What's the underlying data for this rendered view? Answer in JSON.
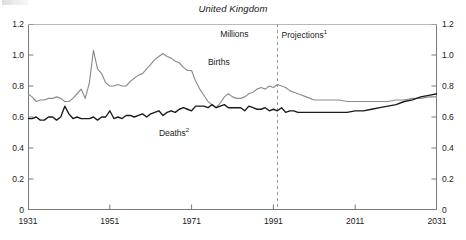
{
  "chart_data": {
    "type": "line",
    "title": "United Kingdom",
    "ylabel": "Millions",
    "xlabel": "",
    "xlim": [
      1931,
      2031
    ],
    "ylim": [
      0,
      1.2
    ],
    "yticks": [
      "0",
      "0.2",
      "0.4",
      "0.6",
      "0.8",
      "1.0",
      "1.2"
    ],
    "ytick_values": [
      0,
      0.2,
      0.4,
      0.6,
      0.8,
      1.0,
      1.2
    ],
    "yticks_right": [
      "0",
      "0.2",
      "0.4",
      "0.6",
      "0.8",
      "1.0",
      "1.2"
    ],
    "xticks": [
      "1931",
      "1951",
      "1971",
      "1991",
      "2011",
      "2031"
    ],
    "xtick_values": [
      1931,
      1951,
      1971,
      1991,
      2011,
      2031
    ],
    "grid": false,
    "legend_position": "inline-labels",
    "annotations": [
      {
        "text": "Millions",
        "x": 1978,
        "y": 1.13
      },
      {
        "text": "Projections",
        "sup": "1",
        "x": 1993,
        "y": 1.13
      },
      {
        "text": "Births",
        "sup": "",
        "x": 1975,
        "y": 0.95
      },
      {
        "text": "Deaths",
        "sup": "2",
        "x": 1963,
        "y": 0.5
      }
    ],
    "projection_divider": {
      "label": "Projections",
      "x": 1992,
      "style": "dashed"
    },
    "series": [
      {
        "name": "Births",
        "color": "#8c8c8c",
        "x": [
          1931,
          1932,
          1933,
          1934,
          1935,
          1936,
          1937,
          1938,
          1939,
          1940,
          1941,
          1942,
          1943,
          1944,
          1945,
          1946,
          1947,
          1948,
          1949,
          1950,
          1951,
          1952,
          1953,
          1954,
          1955,
          1956,
          1957,
          1958,
          1959,
          1960,
          1961,
          1962,
          1963,
          1964,
          1965,
          1966,
          1967,
          1968,
          1969,
          1970,
          1971,
          1972,
          1973,
          1974,
          1975,
          1976,
          1977,
          1978,
          1979,
          1980,
          1981,
          1982,
          1983,
          1984,
          1985,
          1986,
          1987,
          1988,
          1989,
          1990,
          1991,
          1992,
          1993,
          1994,
          1995,
          1996,
          1997,
          1998,
          1999,
          2000,
          2001,
          2003,
          2005,
          2007,
          2009,
          2011,
          2013,
          2015,
          2017,
          2019,
          2021,
          2023,
          2025,
          2027,
          2029,
          2031
        ],
        "values": [
          0.75,
          0.73,
          0.7,
          0.71,
          0.71,
          0.72,
          0.72,
          0.73,
          0.72,
          0.7,
          0.7,
          0.72,
          0.75,
          0.78,
          0.72,
          0.82,
          1.03,
          0.91,
          0.88,
          0.82,
          0.8,
          0.8,
          0.81,
          0.8,
          0.8,
          0.83,
          0.85,
          0.87,
          0.88,
          0.91,
          0.94,
          0.97,
          0.99,
          1.01,
          0.99,
          0.98,
          0.96,
          0.95,
          0.92,
          0.9,
          0.9,
          0.83,
          0.78,
          0.74,
          0.7,
          0.68,
          0.66,
          0.69,
          0.73,
          0.75,
          0.73,
          0.72,
          0.72,
          0.73,
          0.75,
          0.76,
          0.78,
          0.79,
          0.78,
          0.8,
          0.79,
          0.81,
          0.8,
          0.79,
          0.77,
          0.76,
          0.75,
          0.74,
          0.73,
          0.72,
          0.71,
          0.71,
          0.71,
          0.71,
          0.7,
          0.7,
          0.7,
          0.7,
          0.7,
          0.7,
          0.71,
          0.71,
          0.72,
          0.72,
          0.73,
          0.73
        ]
      },
      {
        "name": "Deaths",
        "color": "#1a1a1a",
        "x": [
          1931,
          1932,
          1933,
          1934,
          1935,
          1936,
          1937,
          1938,
          1939,
          1940,
          1941,
          1942,
          1943,
          1944,
          1945,
          1946,
          1947,
          1948,
          1949,
          1950,
          1951,
          1952,
          1953,
          1954,
          1955,
          1956,
          1957,
          1958,
          1959,
          1960,
          1961,
          1962,
          1963,
          1964,
          1965,
          1966,
          1967,
          1968,
          1969,
          1970,
          1971,
          1972,
          1973,
          1974,
          1975,
          1976,
          1977,
          1978,
          1979,
          1980,
          1981,
          1982,
          1983,
          1984,
          1985,
          1986,
          1987,
          1988,
          1989,
          1990,
          1991,
          1992,
          1993,
          1994,
          1995,
          1996,
          1997,
          1998,
          1999,
          2000,
          2001,
          2003,
          2005,
          2007,
          2009,
          2011,
          2013,
          2015,
          2017,
          2019,
          2021,
          2023,
          2025,
          2027,
          2029,
          2031
        ],
        "values": [
          0.59,
          0.59,
          0.6,
          0.58,
          0.58,
          0.6,
          0.6,
          0.58,
          0.6,
          0.67,
          0.62,
          0.59,
          0.6,
          0.59,
          0.59,
          0.59,
          0.6,
          0.58,
          0.6,
          0.6,
          0.64,
          0.59,
          0.6,
          0.59,
          0.61,
          0.61,
          0.6,
          0.61,
          0.62,
          0.6,
          0.62,
          0.63,
          0.64,
          0.61,
          0.63,
          0.64,
          0.63,
          0.65,
          0.66,
          0.65,
          0.64,
          0.67,
          0.67,
          0.67,
          0.66,
          0.68,
          0.66,
          0.67,
          0.68,
          0.66,
          0.66,
          0.66,
          0.66,
          0.64,
          0.67,
          0.66,
          0.65,
          0.65,
          0.66,
          0.64,
          0.65,
          0.64,
          0.66,
          0.63,
          0.64,
          0.64,
          0.63,
          0.63,
          0.63,
          0.63,
          0.63,
          0.63,
          0.63,
          0.63,
          0.63,
          0.64,
          0.64,
          0.65,
          0.66,
          0.67,
          0.68,
          0.7,
          0.71,
          0.73,
          0.74,
          0.75
        ]
      }
    ]
  }
}
